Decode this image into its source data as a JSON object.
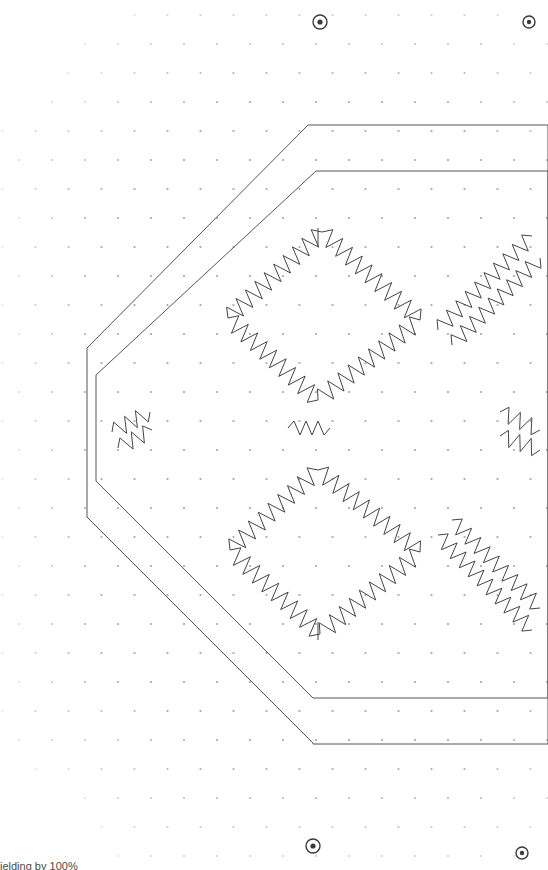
{
  "app": {
    "view_name": "pcb-layout-canvas",
    "background_color": "#ffffff",
    "outline_color": "#555555",
    "trace_color": "#444444",
    "grid_dot_color": "#9a9aa5",
    "hole_color": "#3a3a3a"
  },
  "status_bar": {
    "text": "ielding by 100%",
    "color": "#4a4a4a"
  },
  "canvas": {
    "width": 548,
    "height": 870,
    "zoom_label": "100%"
  },
  "board_outline": {
    "label": "board-outline-octagon",
    "stroke_width": 1,
    "outer_points": "308,125 548,125 548,744 313,744 313,743 87,517 87,348 308,125",
    "inner_points": "316,171 548,171 548,698 313,698 96,481 96,375 316,171"
  },
  "mounting_holes": [
    {
      "name": "mounting-hole-top-left",
      "cx": 320,
      "cy": 22,
      "r_outer": 7,
      "r_inner": 2.6
    },
    {
      "name": "mounting-hole-top-right",
      "cx": 529,
      "cy": 22,
      "r_outer": 6,
      "r_inner": 2.2
    },
    {
      "name": "mounting-hole-bottom-left",
      "cx": 313,
      "cy": 846,
      "r_outer": 7,
      "r_inner": 2.6
    },
    {
      "name": "mounting-hole-bottom-right",
      "cx": 522,
      "cy": 853,
      "r_outer": 6,
      "r_inner": 2.2
    }
  ],
  "grid": {
    "name": "hex-dot-grid",
    "row_spacing": 29,
    "col_spacing": 33,
    "dot_radius": 1.1,
    "stagger": true
  },
  "serpentine_traces": [
    {
      "name": "trace-diamond-upper-left",
      "x1": 228,
      "y1": 318,
      "x2": 322,
      "y2": 232,
      "amp": 9,
      "wavelength": 13
    },
    {
      "name": "trace-diamond-upper-right",
      "x1": 322,
      "y1": 232,
      "x2": 420,
      "y2": 320,
      "amp": 9,
      "wavelength": 13
    },
    {
      "name": "trace-diamond-mid-left",
      "x1": 228,
      "y1": 318,
      "x2": 318,
      "y2": 400,
      "amp": 9,
      "wavelength": 13
    },
    {
      "name": "trace-diamond-mid-right",
      "x1": 318,
      "y1": 400,
      "x2": 420,
      "y2": 320,
      "amp": 9,
      "wavelength": 13
    },
    {
      "name": "trace-diamond-lower-left",
      "x1": 230,
      "y1": 550,
      "x2": 318,
      "y2": 470,
      "amp": 9,
      "wavelength": 13
    },
    {
      "name": "trace-diamond-lower-right",
      "x1": 318,
      "y1": 470,
      "x2": 420,
      "y2": 552,
      "amp": 9,
      "wavelength": 13
    },
    {
      "name": "trace-diamond-bottom-left",
      "x1": 230,
      "y1": 550,
      "x2": 320,
      "y2": 634,
      "amp": 9,
      "wavelength": 13
    },
    {
      "name": "trace-diamond-bottom-right",
      "x1": 320,
      "y1": 634,
      "x2": 420,
      "y2": 552,
      "amp": 9,
      "wavelength": 13
    },
    {
      "name": "trace-right-upper-a",
      "x1": 438,
      "y1": 330,
      "x2": 532,
      "y2": 236,
      "amp": 8,
      "wavelength": 13
    },
    {
      "name": "trace-right-upper-b",
      "x1": 452,
      "y1": 345,
      "x2": 540,
      "y2": 258,
      "amp": 8,
      "wavelength": 13
    },
    {
      "name": "trace-right-lower-a",
      "x1": 438,
      "y1": 535,
      "x2": 532,
      "y2": 630,
      "amp": 8,
      "wavelength": 13
    },
    {
      "name": "trace-right-lower-b",
      "x1": 452,
      "y1": 520,
      "x2": 540,
      "y2": 608,
      "amp": 8,
      "wavelength": 13
    },
    {
      "name": "trace-center-node-left",
      "x1": 288,
      "y1": 428,
      "x2": 330,
      "y2": 428,
      "amp": 7,
      "wavelength": 12
    },
    {
      "name": "trace-left-pad-a",
      "x1": 112,
      "y1": 432,
      "x2": 150,
      "y2": 412,
      "amp": 8,
      "wavelength": 13
    },
    {
      "name": "trace-left-pad-b",
      "x1": 118,
      "y1": 448,
      "x2": 152,
      "y2": 430,
      "amp": 8,
      "wavelength": 13
    },
    {
      "name": "trace-right-pad-a",
      "x1": 500,
      "y1": 412,
      "x2": 540,
      "y2": 430,
      "amp": 8,
      "wavelength": 13
    },
    {
      "name": "trace-right-pad-b",
      "x1": 500,
      "y1": 436,
      "x2": 540,
      "y2": 450,
      "amp": 8,
      "wavelength": 13
    }
  ],
  "trace_stubs": [
    {
      "name": "stub-top-center",
      "x1": 318,
      "y1": 228,
      "x2": 318,
      "y2": 246
    },
    {
      "name": "stub-bottom-center",
      "x1": 318,
      "y1": 622,
      "x2": 318,
      "y2": 640
    }
  ]
}
